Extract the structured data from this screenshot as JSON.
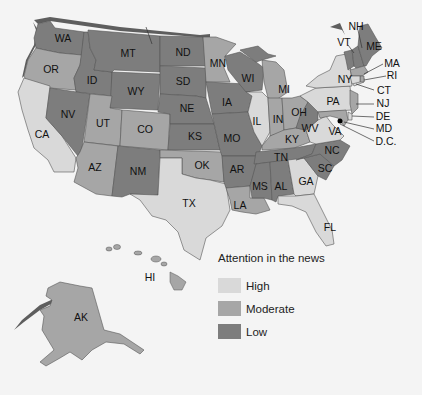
{
  "map": {
    "title": "Attention in the news",
    "colors": {
      "high": "#d9d9d9",
      "moderate": "#a6a6a6",
      "low": "#7d7d7d",
      "shadow": "#5e5e5e"
    },
    "states": [
      {
        "abbr": "WA",
        "level": "low"
      },
      {
        "abbr": "OR",
        "level": "moderate"
      },
      {
        "abbr": "CA",
        "level": "high"
      },
      {
        "abbr": "ID",
        "level": "low"
      },
      {
        "abbr": "NV",
        "level": "low"
      },
      {
        "abbr": "MT",
        "level": "low"
      },
      {
        "abbr": "WY",
        "level": "low"
      },
      {
        "abbr": "UT",
        "level": "moderate"
      },
      {
        "abbr": "AZ",
        "level": "moderate"
      },
      {
        "abbr": "CO",
        "level": "moderate"
      },
      {
        "abbr": "NM",
        "level": "low"
      },
      {
        "abbr": "ND",
        "level": "low"
      },
      {
        "abbr": "SD",
        "level": "low"
      },
      {
        "abbr": "NE",
        "level": "low"
      },
      {
        "abbr": "KS",
        "level": "low"
      },
      {
        "abbr": "OK",
        "level": "moderate"
      },
      {
        "abbr": "TX",
        "level": "high"
      },
      {
        "abbr": "MN",
        "level": "moderate"
      },
      {
        "abbr": "IA",
        "level": "low"
      },
      {
        "abbr": "MO",
        "level": "low"
      },
      {
        "abbr": "AR",
        "level": "low"
      },
      {
        "abbr": "LA",
        "level": "moderate"
      },
      {
        "abbr": "WI",
        "level": "low"
      },
      {
        "abbr": "IL",
        "level": "high"
      },
      {
        "abbr": "MI",
        "level": "moderate"
      },
      {
        "abbr": "IN",
        "level": "moderate"
      },
      {
        "abbr": "OH",
        "level": "moderate"
      },
      {
        "abbr": "KY",
        "level": "moderate"
      },
      {
        "abbr": "TN",
        "level": "low"
      },
      {
        "abbr": "MS",
        "level": "low"
      },
      {
        "abbr": "AL",
        "level": "low"
      },
      {
        "abbr": "GA",
        "level": "high"
      },
      {
        "abbr": "FL",
        "level": "high"
      },
      {
        "abbr": "SC",
        "level": "low"
      },
      {
        "abbr": "NC",
        "level": "low"
      },
      {
        "abbr": "VA",
        "level": "high"
      },
      {
        "abbr": "WV",
        "level": "low"
      },
      {
        "abbr": "PA",
        "level": "high"
      },
      {
        "abbr": "NY",
        "level": "high"
      },
      {
        "abbr": "VT",
        "level": "low"
      },
      {
        "abbr": "NH",
        "level": "low"
      },
      {
        "abbr": "ME",
        "level": "low"
      },
      {
        "abbr": "MA",
        "level": "moderate"
      },
      {
        "abbr": "RI",
        "level": "moderate"
      },
      {
        "abbr": "CT",
        "level": "high"
      },
      {
        "abbr": "NJ",
        "level": "moderate"
      },
      {
        "abbr": "DE",
        "level": "high"
      },
      {
        "abbr": "MD",
        "level": "moderate"
      },
      {
        "abbr": "D.C.",
        "level": "low"
      },
      {
        "abbr": "AK",
        "level": "moderate"
      },
      {
        "abbr": "HI",
        "level": "moderate"
      }
    ]
  },
  "labels": {
    "WA": "WA",
    "OR": "OR",
    "CA": "CA",
    "ID": "ID",
    "NV": "NV",
    "MT": "MT",
    "WY": "WY",
    "UT": "UT",
    "AZ": "AZ",
    "CO": "CO",
    "NM": "NM",
    "ND": "ND",
    "SD": "SD",
    "NE": "NE",
    "KS": "KS",
    "OK": "OK",
    "TX": "TX",
    "MN": "MN",
    "IA": "IA",
    "MO": "MO",
    "AR": "AR",
    "LA": "LA",
    "WI": "WI",
    "IL": "IL",
    "MI": "MI",
    "IN": "IN",
    "OH": "OH",
    "KY": "KY",
    "TN": "TN",
    "MS": "MS",
    "AL": "AL",
    "GA": "GA",
    "FL": "FL",
    "SC": "SC",
    "NC": "NC",
    "VA": "VA",
    "WV": "WV",
    "PA": "PA",
    "NY": "NY",
    "VT": "VT",
    "NH": "NH",
    "ME": "ME",
    "MA": "MA",
    "RI": "RI",
    "CT": "CT",
    "NJ": "NJ",
    "DE": "DE",
    "MD": "MD",
    "DC": "D.C.",
    "AK": "AK",
    "HI": "HI"
  },
  "legend": {
    "title": "Attention in the news",
    "items": [
      {
        "label": "High",
        "color": "#d9d9d9"
      },
      {
        "label": "Moderate",
        "color": "#a6a6a6"
      },
      {
        "label": "Low",
        "color": "#7d7d7d"
      }
    ]
  }
}
